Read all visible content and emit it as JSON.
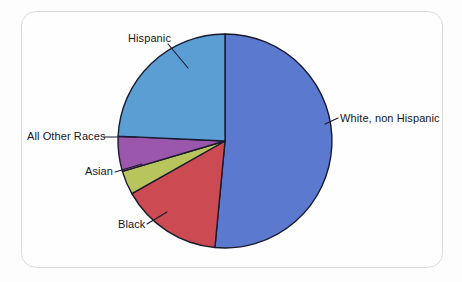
{
  "chart_data": {
    "type": "pie",
    "title": "",
    "subtitle": "",
    "xlabel": "",
    "ylabel": "",
    "legend_position": "none",
    "labels_position": "outside-with-leader-lines",
    "grid": false,
    "start_angle_deg": 0,
    "direction": "clockwise",
    "categories": [
      "White, non Hispanic",
      "Black",
      "Asian",
      "All Other Races",
      "Hispanic"
    ],
    "values": [
      51.5,
      15.3,
      3.6,
      5.3,
      24.3
    ],
    "unit": "percent",
    "slices": [
      {
        "label": "White, non Hispanic",
        "value": 51.5,
        "color": "#5a79cf",
        "start_deg": 0,
        "end_deg": 185.4
      },
      {
        "label": "Black",
        "value": 15.3,
        "color": "#cc4a52",
        "start_deg": 185.4,
        "end_deg": 240.5
      },
      {
        "label": "Asian",
        "value": 3.6,
        "color": "#b7c55c",
        "start_deg": 240.5,
        "end_deg": 253.5
      },
      {
        "label": "All Other Races",
        "value": 5.3,
        "color": "#9b57ac",
        "start_deg": 253.5,
        "end_deg": 272.6
      },
      {
        "label": "Hispanic",
        "value": 24.3,
        "color": "#5a9ed4",
        "start_deg": 272.6,
        "end_deg": 360
      }
    ]
  },
  "labels": {
    "white": "White, non Hispanic",
    "black": "Black",
    "asian": "Asian",
    "all_other_races": "All Other Races",
    "hispanic": "Hispanic"
  },
  "style": {
    "frame_border_color": "#dcdcdc",
    "background_color": "#fdfdfd",
    "slice_outline_color": "#1a1a2e",
    "label_text_color": "#16161d"
  },
  "geometry": {
    "center_x": 225,
    "center_y": 141,
    "radius": 107
  }
}
